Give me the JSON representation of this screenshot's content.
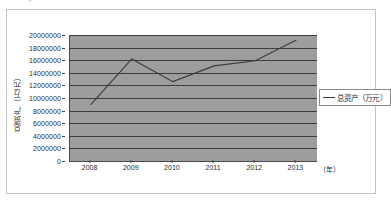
{
  "top_cut_text": "、、' 'l   ' ',.....",
  "chart_data": {
    "type": "line",
    "title": "",
    "xlabel": "（年）",
    "ylabel": "总资产（万元）",
    "categories": [
      "2008",
      "2009",
      "2010",
      "2011",
      "2012",
      "2013"
    ],
    "series": [
      {
        "name": "总资产（万元）",
        "values": [
          8900000,
          16200000,
          12600000,
          15100000,
          15900000,
          19200000
        ]
      }
    ],
    "ylim": [
      0,
      20000000
    ],
    "y_ticks": [
      "0",
      "2000000",
      "4000000",
      "6000000",
      "8000000",
      "10000000",
      "12000000",
      "14000000",
      "16000000",
      "18000000",
      "20000000"
    ],
    "y_tick_values": [
      0,
      2000000,
      4000000,
      6000000,
      8000000,
      10000000,
      12000000,
      14000000,
      16000000,
      18000000,
      20000000
    ],
    "grid": true,
    "legend_position": "right",
    "legend_entries": [
      "总资产（万元）"
    ],
    "colors": {
      "plot_background": "#9d9d9d",
      "gridline": "#3d3d3d",
      "series_line": "#3a3a3a",
      "axis": "#4a4a4a",
      "page_background": "#ffffff",
      "frame_border": "#c2c2c2"
    }
  }
}
